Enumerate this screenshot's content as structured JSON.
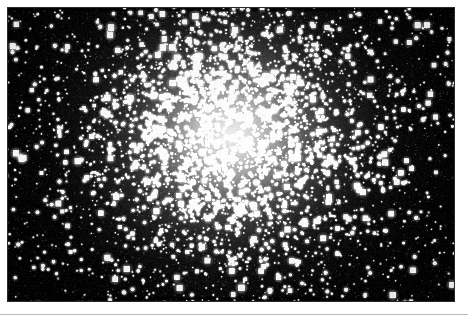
{
  "page": {
    "background_color": "#ffffff",
    "width": 468,
    "height": 320,
    "kind": "scanned-astronomical-photograph"
  },
  "plate": {
    "name": "globular-cluster-photograph",
    "alt_text": "Dense globular star cluster on black sky background",
    "x": 7,
    "y": 7,
    "width": 448,
    "height": 295,
    "sky_color": "#000000",
    "star_color": "#ffffff",
    "core_glow_color": "#f2f2f2",
    "border_color": "#282828"
  },
  "footer_rule": {
    "name": "horizontal-rule",
    "x": 0,
    "y": 314,
    "width": 468,
    "height": 1,
    "color": "#b9b9b9"
  },
  "chart_data": {
    "type": "scatter",
    "xlabel": "",
    "ylabel": "",
    "xlim": [
      0,
      448
    ],
    "ylim": [
      0,
      295
    ],
    "grid": false,
    "legend": null,
    "cluster_center": {
      "x": 223,
      "y": 128
    },
    "core_radius_px": 62,
    "halo_radius_px": 150,
    "field_radius_px": 320,
    "total_stars_drawn": 5200,
    "radial_density_profile": {
      "radius_px": [
        0,
        20,
        40,
        60,
        80,
        110,
        140,
        180,
        230,
        300
      ],
      "relative_density": [
        1.0,
        0.94,
        0.8,
        0.6,
        0.4,
        0.22,
        0.12,
        0.06,
        0.03,
        0.015
      ]
    },
    "radial_brightness_profile": {
      "radius_px": [
        0,
        20,
        35,
        50,
        65,
        85,
        110,
        140,
        175,
        220
      ],
      "mean_gray_0_to_255": [
        240,
        215,
        180,
        140,
        100,
        62,
        34,
        16,
        7,
        2
      ]
    },
    "star_magnitude_bins": {
      "labels": [
        "bright",
        "medium",
        "faint"
      ],
      "radius_px": [
        2.3,
        1.5,
        0.9
      ],
      "fraction": [
        0.1,
        0.32,
        0.58
      ]
    },
    "random_seed": 20240517
  }
}
